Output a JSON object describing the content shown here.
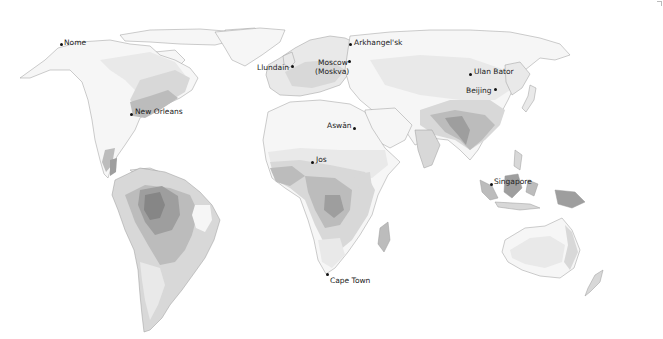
{
  "map": {
    "type": "world-map-grayscale-zones",
    "colors": {
      "background": "#ffffff",
      "zone_lightest": "#f6f6f6",
      "zone_light": "#e9e9e9",
      "zone_medium_light": "#d8d8d8",
      "zone_medium": "#bcbcbc",
      "zone_dark": "#9e9e9e",
      "zone_darkest": "#868686"
    },
    "cities": [
      {
        "name": "Nome",
        "x": 61,
        "y": 44,
        "label_x": 64,
        "label_y": 38
      },
      {
        "name": "Arkhangel'sk",
        "x": 350,
        "y": 44,
        "label_x": 354,
        "label_y": 38
      },
      {
        "name": "Moscow",
        "x": 349,
        "y": 62,
        "label_x": 317,
        "label_y": 59
      },
      {
        "name": "(Moskva)",
        "x": null,
        "y": null,
        "label_x": 316,
        "label_y": 68
      },
      {
        "name": "Llundain",
        "x": 292,
        "y": 66,
        "label_x": 257,
        "label_y": 63
      },
      {
        "name": "Ulan Bator",
        "x": 470,
        "y": 74,
        "label_x": 473,
        "label_y": 68
      },
      {
        "name": "Beijing",
        "x": 495,
        "y": 89,
        "label_x": 466,
        "label_y": 86
      },
      {
        "name": "New Orleans",
        "x": 131,
        "y": 114,
        "label_x": 134,
        "label_y": 107
      },
      {
        "name": "Aswān",
        "x": 354,
        "y": 128,
        "label_x": 327,
        "label_y": 121
      },
      {
        "name": "Jos",
        "x": 312,
        "y": 162,
        "label_x": 316,
        "label_y": 156
      },
      {
        "name": "Singapore",
        "x": 491,
        "y": 184,
        "label_x": 494,
        "label_y": 178
      },
      {
        "name": "Cape Town",
        "x": 327,
        "y": 274,
        "label_x": 330,
        "label_y": 277
      }
    ]
  }
}
